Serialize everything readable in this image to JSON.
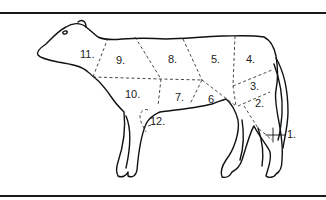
{
  "figure": {
    "type": "beef cuts diagram",
    "labels": [
      {
        "id": "1",
        "text": "1.",
        "x": 287,
        "y": 137
      },
      {
        "id": "2",
        "text": "2.",
        "x": 257,
        "y": 105
      },
      {
        "id": "3",
        "text": "3.",
        "x": 250,
        "y": 89
      },
      {
        "id": "4",
        "text": "4.",
        "x": 246,
        "y": 61
      },
      {
        "id": "5",
        "text": "5.",
        "x": 211,
        "y": 61
      },
      {
        "id": "6",
        "text": "6.",
        "x": 208,
        "y": 101
      },
      {
        "id": "7",
        "text": "7.",
        "x": 175,
        "y": 99
      },
      {
        "id": "8",
        "text": "8.",
        "x": 168,
        "y": 61
      },
      {
        "id": "9",
        "text": "9.",
        "x": 116,
        "y": 62
      },
      {
        "id": "10",
        "text": "10.",
        "x": 125,
        "y": 96
      },
      {
        "id": "11",
        "text": "11.",
        "x": 80,
        "y": 56
      },
      {
        "id": "12",
        "text": "12.",
        "x": 150,
        "y": 123
      }
    ],
    "colors": {
      "line": "#111111",
      "background": "#ffffff"
    }
  }
}
